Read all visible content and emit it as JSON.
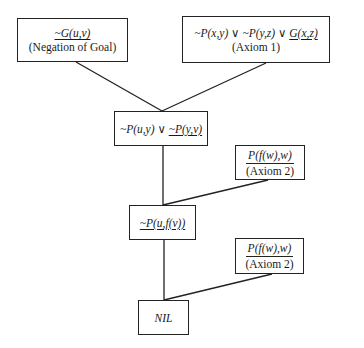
{
  "diagram": {
    "type": "resolution-refutation-tree",
    "nodes": [
      {
        "id": "neg_goal",
        "formula": "~G(u,v)",
        "label": "(Negation of Goal)"
      },
      {
        "id": "axiom1",
        "formula_parts": [
          "~P(x,y) ∨ ~P(y,z) ∨ ",
          "G(x,z)"
        ],
        "label": "(Axiom 1)"
      },
      {
        "id": "resolvent1",
        "formula_parts": [
          "~P(u,y) ∨ ",
          "~P(y,v)"
        ]
      },
      {
        "id": "axiom2a",
        "formula": "P(f(w),w)",
        "label": "(Axiom 2)"
      },
      {
        "id": "resolvent2",
        "formula": "~P(u,f(v))"
      },
      {
        "id": "axiom2b",
        "formula": "P(f(w),w)",
        "label": "(Axiom 2)"
      },
      {
        "id": "nil",
        "formula": "NIL"
      }
    ],
    "edges": [
      [
        "neg_goal",
        "resolvent1"
      ],
      [
        "axiom1",
        "resolvent1"
      ],
      [
        "resolvent1",
        "resolvent2"
      ],
      [
        "axiom2a",
        "resolvent2"
      ],
      [
        "resolvent2",
        "nil"
      ],
      [
        "axiom2b",
        "nil"
      ]
    ]
  }
}
